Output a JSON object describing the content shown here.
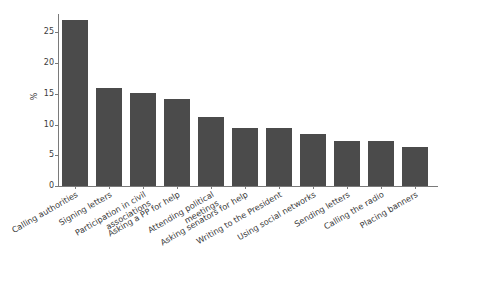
{
  "chart_data": {
    "type": "bar",
    "title": "",
    "subtitle": "",
    "xlabel": "",
    "ylabel": "%",
    "ylim": [
      0,
      28
    ],
    "yticks": [
      0,
      5,
      10,
      15,
      20,
      25
    ],
    "grid": false,
    "legend": null,
    "bar_color": "#4b4b4b",
    "axis_color": "#7a7a7a",
    "background": "#ffffff",
    "categories": [
      "Calling authorities",
      "Signing letters",
      "Participation in civil associations",
      "Asking a PP for help",
      "Attending political meetings",
      "Asking senators for help",
      "Writing to the President",
      "Using social networks",
      "Sending letters",
      "Calling the radio",
      "Placing banners"
    ],
    "values": [
      27.0,
      16.0,
      15.1,
      14.1,
      11.3,
      9.5,
      9.5,
      8.4,
      7.3,
      7.3,
      6.3
    ]
  }
}
